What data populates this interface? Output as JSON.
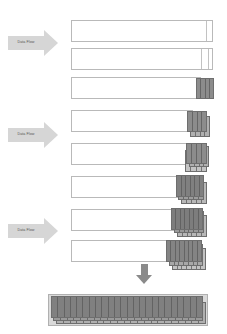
{
  "diagram": {
    "background_color": "#ffffff",
    "canvas": {
      "width": 227,
      "height": 334
    },
    "palette": {
      "arrow_fill": "#d6d6d6",
      "arrow_label_color": "#555555",
      "bar_fill": "#ffffff",
      "bar_border": "#b9b9b9",
      "block_border": "#6e6e6e",
      "block_fill_dark": "#7a7a7a",
      "block_fill_mid": "#8f8f8f",
      "block_fill_light": "#b3b3b3",
      "down_arrow_fill": "#8a8a8a",
      "final_bar_fill": "#d9d9d9"
    },
    "flow_arrows": [
      {
        "label": "Data Flow",
        "x": 8,
        "y": 30,
        "shaft_w": 36,
        "direction": "right"
      },
      {
        "label": "Data Flow",
        "x": 8,
        "y": 122,
        "shaft_w": 36,
        "direction": "right"
      },
      {
        "label": "Data Flow",
        "x": 8,
        "y": 218,
        "shaft_w": 36,
        "direction": "right"
      }
    ],
    "down_arrow": {
      "x": 136,
      "y": 264,
      "direction": "down"
    },
    "rows": [
      {
        "index": 1,
        "x": 71,
        "y": 20,
        "w": 142,
        "h": 22,
        "segments": [
          0.945
        ],
        "blocks": []
      },
      {
        "index": 2,
        "x": 71,
        "y": 48,
        "w": 142,
        "h": 22,
        "segments": [
          0.905,
          0.955
        ],
        "blocks": []
      },
      {
        "index": 3,
        "x": 71,
        "y": 77,
        "w": 130,
        "h": 22,
        "segments": [],
        "blocks": [
          {
            "x": 196,
            "y": 78,
            "w": 18,
            "h": 21,
            "fill": "#8c8c8c",
            "stripes": 4,
            "z": 1
          }
        ]
      },
      {
        "index": 4,
        "x": 71,
        "y": 110,
        "w": 122,
        "h": 22,
        "segments": [],
        "blocks": [
          {
            "x": 190,
            "y": 116,
            "w": 20,
            "h": 21,
            "fill": "#b0b0b0",
            "stripes": 4,
            "z": 1
          },
          {
            "x": 187,
            "y": 111,
            "w": 20,
            "h": 21,
            "fill": "#8c8c8c",
            "stripes": 4,
            "z": 2
          }
        ]
      },
      {
        "index": 5,
        "x": 71,
        "y": 143,
        "w": 118,
        "h": 22,
        "segments": [],
        "blocks": [
          {
            "x": 185,
            "y": 150,
            "w": 22,
            "h": 22,
            "fill": "#c4c4c4",
            "stripes": 4,
            "z": 1
          },
          {
            "x": 189,
            "y": 146,
            "w": 20,
            "h": 21,
            "fill": "#b0b0b0",
            "stripes": 4,
            "z": 2
          },
          {
            "x": 186,
            "y": 143,
            "w": 21,
            "h": 21,
            "fill": "#8c8c8c",
            "stripes": 4,
            "z": 3
          }
        ]
      },
      {
        "index": 6,
        "x": 71,
        "y": 176,
        "w": 110,
        "h": 22,
        "segments": [],
        "blocks": [
          {
            "x": 181,
            "y": 182,
            "w": 26,
            "h": 22,
            "fill": "#b8b8b8",
            "stripes": 5,
            "z": 1
          },
          {
            "x": 178,
            "y": 178,
            "w": 26,
            "h": 22,
            "fill": "#9d9d9d",
            "stripes": 5,
            "z": 2
          },
          {
            "x": 176,
            "y": 175,
            "w": 28,
            "h": 22,
            "fill": "#808080",
            "stripes": 6,
            "z": 3
          }
        ]
      },
      {
        "index": 7,
        "x": 71,
        "y": 209,
        "w": 104,
        "h": 22,
        "segments": [],
        "blocks": [
          {
            "x": 177,
            "y": 215,
            "w": 30,
            "h": 22,
            "fill": "#b8b8b8",
            "stripes": 6,
            "z": 1
          },
          {
            "x": 174,
            "y": 211,
            "w": 30,
            "h": 22,
            "fill": "#9a9a9a",
            "stripes": 6,
            "z": 2
          },
          {
            "x": 171,
            "y": 208,
            "w": 32,
            "h": 22,
            "fill": "#7d7d7d",
            "stripes": 7,
            "z": 3
          }
        ]
      },
      {
        "index": 8,
        "x": 71,
        "y": 240,
        "w": 100,
        "h": 22,
        "segments": [],
        "blocks": [
          {
            "x": 172,
            "y": 248,
            "w": 34,
            "h": 22,
            "fill": "#c2c2c2",
            "stripes": 7,
            "z": 1
          },
          {
            "x": 169,
            "y": 244,
            "w": 34,
            "h": 22,
            "fill": "#a8a8a8",
            "stripes": 7,
            "z": 2
          },
          {
            "x": 166,
            "y": 240,
            "w": 36,
            "h": 22,
            "fill": "#848484",
            "stripes": 8,
            "z": 3
          }
        ]
      }
    ],
    "final_bar": {
      "x": 48,
      "y": 294,
      "w": 160,
      "h": 32,
      "layers": [
        {
          "x": 56,
          "y": 302,
          "w": 150,
          "h": 22,
          "fill": "#b0b0b0",
          "stripes": 22,
          "z": 1
        },
        {
          "x": 53,
          "y": 299,
          "w": 150,
          "h": 22,
          "fill": "#9a9a9a",
          "stripes": 22,
          "z": 2
        },
        {
          "x": 51,
          "y": 296,
          "w": 152,
          "h": 22,
          "fill": "#808080",
          "stripes": 24,
          "z": 3
        }
      ]
    }
  }
}
